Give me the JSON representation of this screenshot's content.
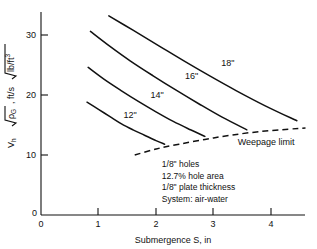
{
  "chart_data": {
    "type": "line",
    "title": "",
    "xlabel": "Submergence S, in",
    "ylabel": "Vh √ρG , ft/s √(lb/ft³)",
    "ylabel_parts": {
      "symbol": "V",
      "symbol_sub": "h",
      "radical1": "ρ",
      "radical1_sub": "G",
      "mid": ", ft/s",
      "radical2": "lb/ft",
      "radical2_sup": "3"
    },
    "xlim": [
      0,
      4.6
    ],
    "ylim": [
      0,
      34
    ],
    "xticks": [
      0,
      1,
      2,
      3,
      4
    ],
    "xtick_labels": [
      "0",
      "1",
      "2",
      "3",
      "4"
    ],
    "yticks": [
      0,
      10,
      20,
      30
    ],
    "ytick_labels": [
      "0",
      "10",
      "20",
      "30"
    ],
    "grid": false,
    "legend": "inline-curve-labels",
    "series": [
      {
        "name": "12\"",
        "label": "12\"",
        "label_x": 1.55,
        "label_y": 16.2,
        "style": "solid",
        "points": [
          [
            0.8,
            18.8
          ],
          [
            1.0,
            17.6
          ],
          [
            1.2,
            16.4
          ],
          [
            1.4,
            15.2
          ],
          [
            1.6,
            14.2
          ],
          [
            1.8,
            13.3
          ],
          [
            2.0,
            12.4
          ],
          [
            2.15,
            11.8
          ]
        ]
      },
      {
        "name": "14\"",
        "label": "14\"",
        "label_x": 2.02,
        "label_y": 19.5,
        "style": "solid",
        "points": [
          [
            0.82,
            24.6
          ],
          [
            1.1,
            22.6
          ],
          [
            1.4,
            20.7
          ],
          [
            1.7,
            18.9
          ],
          [
            2.0,
            17.2
          ],
          [
            2.3,
            15.6
          ],
          [
            2.6,
            14.2
          ],
          [
            2.85,
            13.1
          ]
        ]
      },
      {
        "name": "16\"",
        "label": "16\"",
        "label_x": 2.62,
        "label_y": 22.6,
        "style": "solid",
        "points": [
          [
            0.86,
            30.6
          ],
          [
            1.2,
            28.1
          ],
          [
            1.55,
            25.7
          ],
          [
            1.95,
            23.2
          ],
          [
            2.35,
            20.8
          ],
          [
            2.75,
            18.5
          ],
          [
            3.15,
            16.3
          ],
          [
            3.58,
            14.2
          ]
        ]
      },
      {
        "name": "18\"",
        "label": "18\"",
        "label_x": 3.25,
        "label_y": 24.8,
        "style": "solid",
        "points": [
          [
            1.18,
            33.2
          ],
          [
            1.6,
            30.8
          ],
          [
            2.05,
            28.2
          ],
          [
            2.5,
            25.6
          ],
          [
            2.95,
            23.1
          ],
          [
            3.4,
            20.7
          ],
          [
            3.9,
            18.2
          ],
          [
            4.45,
            15.7
          ]
        ]
      },
      {
        "name": "Weepage limit",
        "label": "Weepage limit",
        "label_x": 3.42,
        "label_y": 11.6,
        "style": "dashed",
        "points": [
          [
            1.63,
            10.0
          ],
          [
            2.0,
            11.0
          ],
          [
            2.4,
            11.8
          ],
          [
            2.85,
            12.6
          ],
          [
            3.3,
            13.3
          ],
          [
            3.8,
            13.9
          ],
          [
            4.3,
            14.3
          ],
          [
            4.6,
            14.5
          ]
        ]
      }
    ],
    "annotations": [
      "1/8\" holes",
      "12.7% hole area",
      "1/8\" plate thickness",
      "System: air-water"
    ],
    "annotation_position": {
      "x": 2.1,
      "y": 8.0
    }
  },
  "colors": {
    "ink": "#111111",
    "background": "#ffffff"
  }
}
